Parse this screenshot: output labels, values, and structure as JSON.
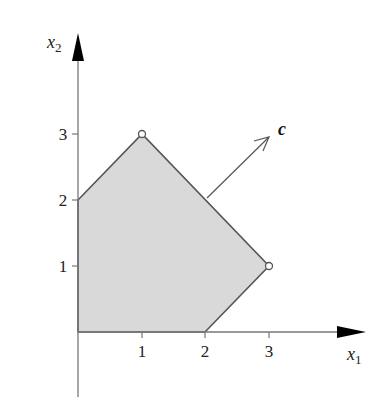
{
  "diagram": {
    "axes": {
      "x": {
        "label_main": "x",
        "label_sub": "1",
        "ticks": [
          "1",
          "2",
          "3"
        ]
      },
      "y": {
        "label_main": "x",
        "label_sub": "2",
        "ticks": [
          "1",
          "2",
          "3"
        ]
      }
    },
    "polygon": {
      "vertices": [
        [
          0,
          0
        ],
        [
          0,
          2
        ],
        [
          1,
          3
        ],
        [
          3,
          1
        ],
        [
          2,
          0
        ]
      ],
      "marked_vertices": [
        [
          1,
          3
        ],
        [
          3,
          1
        ]
      ],
      "fill": "#d9d9d9",
      "stroke": "#555555"
    },
    "vector": {
      "label": "c",
      "from": [
        2.0,
        2.0
      ],
      "to": [
        3.0,
        3.0
      ]
    },
    "colors": {
      "axis": "#777777",
      "arrowhead": "#000000",
      "text": "#222222"
    }
  }
}
